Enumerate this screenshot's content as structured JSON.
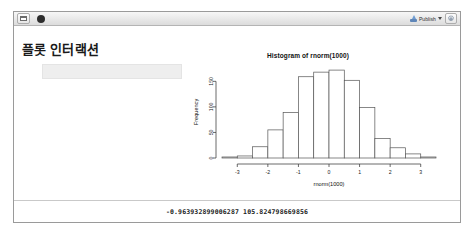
{
  "window": {
    "toolbar": {
      "window_icon": "window-pane-icon",
      "stop_indicator": "busy-stop-icon",
      "publish_icon": "publish-upload-icon",
      "publish_label": "Publish",
      "publish_caret": "chevron-down-icon",
      "settings_icon": "gear-icon"
    }
  },
  "main": {
    "page_title": "플롯 인터랙션",
    "select_input_value": "",
    "select_input_placeholder": ""
  },
  "output": {
    "text": "-0.963932899006287 105.824798669856"
  },
  "chart_data": {
    "type": "bar",
    "title": "Histogram of rnorm(1000)",
    "xlabel": "rnorm(1000)",
    "ylabel": "Frequency",
    "xlim": [
      -3.5,
      3.5
    ],
    "ylim": [
      0,
      180
    ],
    "xticks": [
      -3,
      -2,
      -1,
      0,
      1,
      2,
      3
    ],
    "yticks": [
      0,
      50,
      100,
      150
    ],
    "grid": false,
    "legend": false,
    "bin_width": 0.5,
    "bin_edges": [
      -3.5,
      -3.0,
      -2.5,
      -2.0,
      -1.5,
      -1.0,
      -0.5,
      0.0,
      0.5,
      1.0,
      1.5,
      2.0,
      2.5,
      3.0,
      3.5
    ],
    "categories": [
      "-3.5–-3.0",
      "-3.0–-2.5",
      "-2.5–-2.0",
      "-2.0–-1.5",
      "-1.5–-1.0",
      "-1.0–-0.5",
      "-0.5–0.0",
      "0.0–0.5",
      "0.5–1.0",
      "1.0–1.5",
      "1.5–2.0",
      "2.0–2.5",
      "2.5–3.0",
      "3.0–3.5"
    ],
    "values": [
      2,
      4,
      22,
      55,
      89,
      159,
      168,
      172,
      152,
      99,
      38,
      20,
      8,
      2
    ],
    "bar_fill": "#ffffff",
    "bar_stroke": "#555555"
  }
}
